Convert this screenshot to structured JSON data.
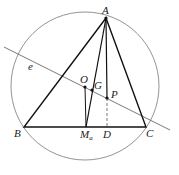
{
  "diagram": {
    "points": {
      "A": {
        "label": "A",
        "x": 106,
        "y": 18
      },
      "B": {
        "label": "B",
        "x": 24,
        "y": 127
      },
      "C": {
        "label": "C",
        "x": 146,
        "y": 127
      },
      "O": {
        "label": "O",
        "x": 85,
        "y": 87
      },
      "G": {
        "label": "G",
        "x": 92,
        "y": 90
      },
      "P": {
        "label": "P",
        "x": 107,
        "y": 98
      },
      "Ma": {
        "label": "M",
        "sub": "a",
        "x": 86,
        "y": 127
      },
      "D": {
        "label": "D",
        "x": 107,
        "y": 127
      }
    },
    "line_label": "e",
    "circle": {
      "cx": 85,
      "cy": 86,
      "r": 74
    }
  }
}
